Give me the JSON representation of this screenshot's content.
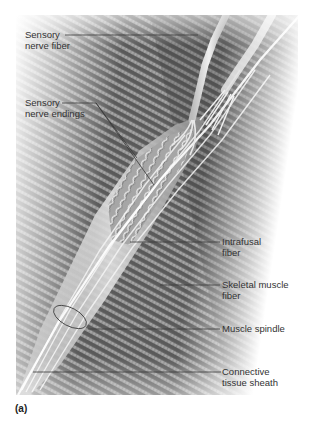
{
  "figure": {
    "panel_label": "(a)",
    "labels": [
      {
        "id": "sensory-nerve-fiber",
        "lines": [
          "Sensory",
          "nerve fiber"
        ],
        "side": "left"
      },
      {
        "id": "sensory-nerve-endings",
        "lines": [
          "Sensory",
          "nerve endings"
        ],
        "side": "left"
      },
      {
        "id": "intrafusal-fiber",
        "lines": [
          "Intrafusal",
          "fiber"
        ],
        "side": "right"
      },
      {
        "id": "skeletal-muscle-fiber",
        "lines": [
          "Skeletal muscle",
          "fiber"
        ],
        "side": "right"
      },
      {
        "id": "muscle-spindle",
        "lines": [
          "Muscle spindle"
        ],
        "side": "right"
      },
      {
        "id": "connective-tissue-sheath",
        "lines": [
          "Connective",
          "tissue sheath"
        ],
        "side": "right"
      }
    ],
    "colors": {
      "background": "#ffffff",
      "muscle_dark": "#4a4a4a",
      "muscle_light": "#bdbdbd",
      "spindle": "#d8d8d8",
      "leader_line": "#3a3a3a",
      "text": "#333333"
    }
  }
}
